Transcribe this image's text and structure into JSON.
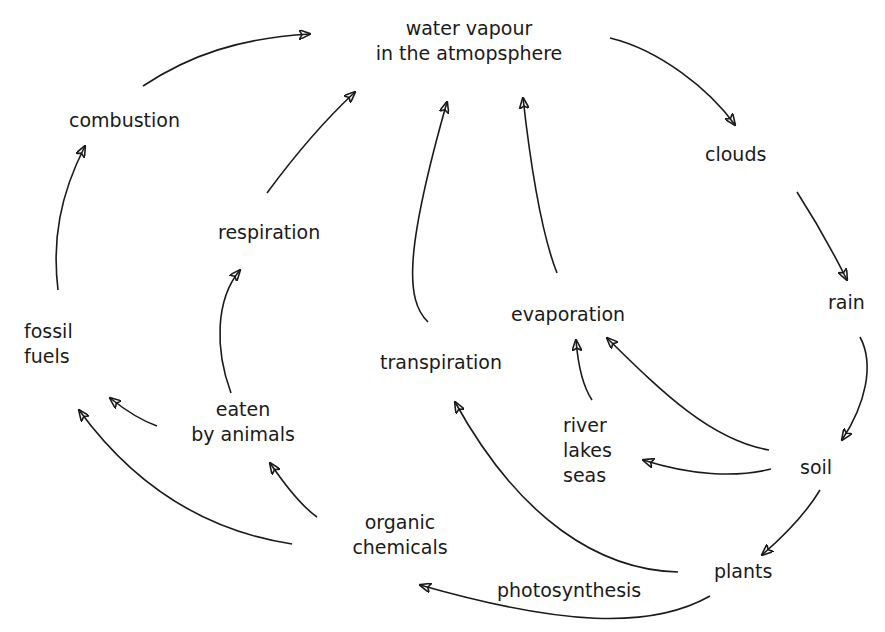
{
  "diagram": {
    "type": "cycle-flow",
    "background": "#ffffff",
    "stroke_color": "#1a1a1a",
    "nodes": {
      "water_vapour": {
        "line1": "water vapour",
        "line2": "in the atmopsphere"
      },
      "clouds": "clouds",
      "rain": "rain",
      "soil": "soil",
      "plants": "plants",
      "river_lakes_seas": {
        "line1": "river",
        "line2": "lakes",
        "line3": "seas"
      },
      "evaporation": "evaporation",
      "transpiration": "transpiration",
      "photosynthesis": "photosynthesis",
      "organic_chemicals": {
        "line1": "organic",
        "line2": "chemicals"
      },
      "eaten_by_animals": {
        "line1": "eaten",
        "line2": "by animals"
      },
      "respiration": "respiration",
      "fossil_fuels": {
        "line1": "fossil",
        "line2": "fuels"
      },
      "combustion": "combustion"
    },
    "edges": [
      {
        "from": "water vapour in the atmopsphere",
        "to": "clouds"
      },
      {
        "from": "clouds",
        "to": "rain"
      },
      {
        "from": "rain",
        "to": "soil"
      },
      {
        "from": "soil",
        "to": "plants"
      },
      {
        "from": "soil",
        "to": "river lakes seas"
      },
      {
        "from": "soil",
        "to": "evaporation"
      },
      {
        "from": "river lakes seas",
        "to": "evaporation"
      },
      {
        "from": "evaporation",
        "to": "water vapour in the atmopsphere"
      },
      {
        "from": "plants",
        "to": "transpiration"
      },
      {
        "from": "transpiration",
        "to": "water vapour in the atmopsphere"
      },
      {
        "from": "plants",
        "to": "organic chemicals",
        "label": "photosynthesis"
      },
      {
        "from": "organic chemicals",
        "to": "eaten by animals"
      },
      {
        "from": "organic chemicals",
        "to": "fossil fuels"
      },
      {
        "from": "eaten by animals",
        "to": "fossil fuels"
      },
      {
        "from": "eaten by animals",
        "to": "respiration"
      },
      {
        "from": "respiration",
        "to": "water vapour in the atmopsphere"
      },
      {
        "from": "fossil fuels",
        "to": "combustion"
      },
      {
        "from": "combustion",
        "to": "water vapour in the atmopsphere"
      }
    ]
  }
}
